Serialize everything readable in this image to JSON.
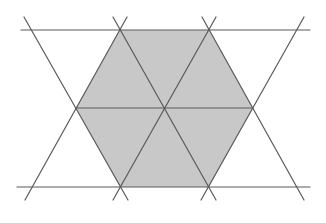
{
  "diagram": {
    "title": "",
    "colors": {
      "background": "#ffffff",
      "fill": "#c8c8c8",
      "line": "#5a5a5a",
      "line_light": "#6e6e6e"
    },
    "hexagon": {
      "points": [
        [
          120,
          30
        ],
        [
          209,
          30
        ],
        [
          253,
          108
        ],
        [
          209,
          187
        ],
        [
          120,
          187
        ],
        [
          76,
          108
        ]
      ],
      "center": [
        164,
        108
      ]
    },
    "triangles": [
      {
        "points": [
          [
            120,
            30
          ],
          [
            209,
            30
          ],
          [
            164,
            108
          ]
        ]
      },
      {
        "points": [
          [
            209,
            30
          ],
          [
            253,
            108
          ],
          [
            164,
            108
          ]
        ]
      },
      {
        "points": [
          [
            253,
            108
          ],
          [
            209,
            187
          ],
          [
            164,
            108
          ]
        ]
      },
      {
        "points": [
          [
            209,
            187
          ],
          [
            120,
            187
          ],
          [
            164,
            108
          ]
        ]
      },
      {
        "points": [
          [
            120,
            187
          ],
          [
            76,
            108
          ],
          [
            164,
            108
          ]
        ]
      },
      {
        "points": [
          [
            76,
            108
          ],
          [
            120,
            30
          ],
          [
            164,
            108
          ]
        ]
      }
    ],
    "lines": [
      {
        "name": "top-horizontal-line",
        "x1": 21,
        "y1": 30,
        "x2": 310,
        "y2": 30
      },
      {
        "name": "middle-horizontal-line",
        "x1": 76,
        "y1": 108,
        "x2": 253,
        "y2": 108
      },
      {
        "name": "bottom-horizontal-line",
        "x1": 17,
        "y1": 187,
        "x2": 310,
        "y2": 187
      },
      {
        "name": "diagonal-line-1",
        "x1": 24,
        "y1": 17,
        "x2": 128,
        "y2": 200
      },
      {
        "name": "diagonal-line-2",
        "x1": 113,
        "y1": 17,
        "x2": 216,
        "y2": 200
      },
      {
        "name": "diagonal-line-3",
        "x1": 202,
        "y1": 17,
        "x2": 304,
        "y2": 200
      },
      {
        "name": "diagonal-line-4",
        "x1": 127,
        "y1": 17,
        "x2": 25,
        "y2": 200
      },
      {
        "name": "diagonal-line-5",
        "x1": 216,
        "y1": 17,
        "x2": 113,
        "y2": 200
      },
      {
        "name": "diagonal-line-6",
        "x1": 304,
        "y1": 17,
        "x2": 201,
        "y2": 200
      }
    ]
  }
}
